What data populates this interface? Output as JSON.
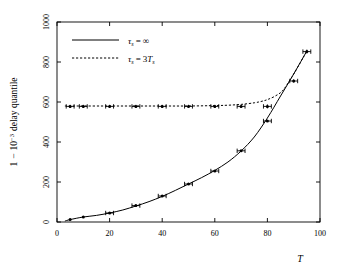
{
  "chart_data": {
    "type": "line",
    "title": "",
    "xlabel": "T",
    "ylabel": "1 − 10⁻³ delay quantile",
    "xlim": [
      0,
      100
    ],
    "ylim": [
      0,
      1000
    ],
    "xticks": [
      0,
      20,
      40,
      60,
      80,
      100
    ],
    "xtick_labels": [
      "0",
      "20",
      "40",
      "60",
      "80",
      "100"
    ],
    "yticks": [
      0,
      200,
      400,
      600,
      800,
      1000
    ],
    "ytick_labels": [
      "0",
      "200",
      "400",
      "600",
      "800",
      "1000"
    ],
    "grid": false,
    "legend_position": "upper left",
    "series": [
      {
        "name": "τₛ = ∞",
        "style": "solid",
        "x": [
          3,
          5,
          10,
          15,
          20,
          25,
          30,
          35,
          40,
          45,
          50,
          55,
          60,
          65,
          70,
          75,
          80,
          85,
          90,
          95
        ],
        "values": [
          5,
          12,
          25,
          33,
          45,
          60,
          80,
          102,
          128,
          158,
          190,
          222,
          258,
          300,
          355,
          425,
          520,
          630,
          740,
          855
        ]
      },
      {
        "name": "τₛ = 3Tₛ",
        "style": "dashed",
        "x": [
          3,
          10,
          20,
          30,
          40,
          50,
          60,
          65,
          70,
          75,
          78,
          80,
          83,
          86,
          90,
          95
        ],
        "values": [
          580,
          580,
          580,
          580,
          580,
          580,
          582,
          584,
          588,
          596,
          604,
          612,
          630,
          660,
          740,
          855
        ]
      }
    ],
    "markers": [
      {
        "name": "τₛ = ∞ measurements",
        "points": [
          {
            "x": 5,
            "y": 12,
            "xerr": 0,
            "yerr": 4
          },
          {
            "x": 10,
            "y": 25,
            "xerr": 0,
            "yerr": 4
          },
          {
            "x": 20,
            "y": 45,
            "xerr": 1.5,
            "yerr": 4
          },
          {
            "x": 30,
            "y": 82,
            "xerr": 1.5,
            "yerr": 4
          },
          {
            "x": 40,
            "y": 130,
            "xerr": 1.5,
            "yerr": 4
          },
          {
            "x": 50,
            "y": 190,
            "xerr": 1.5,
            "yerr": 4
          },
          {
            "x": 60,
            "y": 255,
            "xerr": 1.5,
            "yerr": 4
          },
          {
            "x": 70,
            "y": 356,
            "xerr": 1.5,
            "yerr": 4
          },
          {
            "x": 80,
            "y": 505,
            "xerr": 1.5,
            "yerr": 4
          },
          {
            "x": 90,
            "y": 705,
            "xerr": 1.5,
            "yerr": 8
          },
          {
            "x": 95,
            "y": 852,
            "xerr": 1.5,
            "yerr": 10
          }
        ]
      },
      {
        "name": "τₛ = 3Tₛ measurements",
        "points": [
          {
            "x": 5,
            "y": 578,
            "xerr": 1.5,
            "yerr": 8
          },
          {
            "x": 10,
            "y": 578,
            "xerr": 1.5,
            "yerr": 8
          },
          {
            "x": 20,
            "y": 578,
            "xerr": 1.5,
            "yerr": 8
          },
          {
            "x": 30,
            "y": 578,
            "xerr": 1.5,
            "yerr": 8
          },
          {
            "x": 40,
            "y": 578,
            "xerr": 1.5,
            "yerr": 8
          },
          {
            "x": 50,
            "y": 578,
            "xerr": 1.5,
            "yerr": 8
          },
          {
            "x": 60,
            "y": 578,
            "xerr": 1.5,
            "yerr": 8
          },
          {
            "x": 70,
            "y": 578,
            "xerr": 1.5,
            "yerr": 8
          },
          {
            "x": 80,
            "y": 578,
            "xerr": 1.5,
            "yerr": 10
          }
        ]
      }
    ],
    "legend": [
      {
        "label": "τₛ = ∞",
        "style": "solid"
      },
      {
        "label": "τₛ = 3Tₛ",
        "style": "dashed"
      }
    ]
  },
  "legend": {
    "entry0_tau": "τ",
    "entry0_sub": "s",
    "entry0_eq": "=",
    "entry0_val": "∞",
    "entry1_tau": "τ",
    "entry1_sub": "s",
    "entry1_eq": "=",
    "entry1_val": "3",
    "entry1_val_T": "T",
    "entry1_val_sub": "s"
  },
  "axes": {
    "xlabel": "T",
    "ylabel_part1": "1",
    "ylabel_minus": "−",
    "ylabel_base": "10",
    "ylabel_exp": "−3",
    "ylabel_part2": "delay quantile"
  }
}
